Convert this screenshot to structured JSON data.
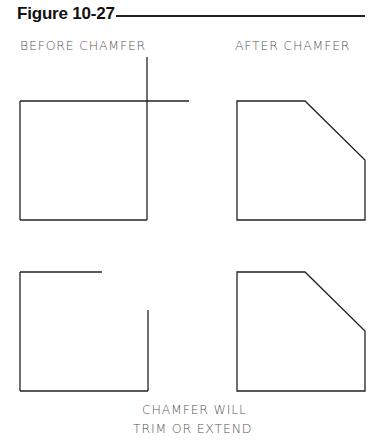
{
  "figure": {
    "title": "Figure 10-27"
  },
  "labels": {
    "before": "BEFORE CHAMFER",
    "after": "AFTER CHAMFER",
    "caption_line1": "CHAMFER WILL",
    "caption_line2": "TRIM OR EXTEND"
  },
  "colors": {
    "line": "#222222",
    "label_text": "#555555"
  },
  "drawings": [
    {
      "name": "before-overlapping",
      "description": "square with overlapping top and right edges extending past corner"
    },
    {
      "name": "after-chamfer-top",
      "description": "square with chamfered top-right corner"
    },
    {
      "name": "before-gap",
      "description": "square with top and right edges stopping short of corner"
    },
    {
      "name": "after-chamfer-bottom",
      "description": "square with chamfered top-right corner"
    }
  ]
}
